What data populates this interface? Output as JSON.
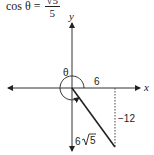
{
  "formula": {
    "lhs": "cos θ =",
    "numerator": "√5",
    "denominator": "5"
  },
  "diagram": {
    "axes": {
      "x_label": "x",
      "y_label": "y"
    },
    "angle_label": "θ",
    "adjacent_label": "6",
    "opposite_label": "−12",
    "hypotenuse_label": "6√5",
    "hyp_coeff": "6",
    "hyp_radicand": "5"
  }
}
